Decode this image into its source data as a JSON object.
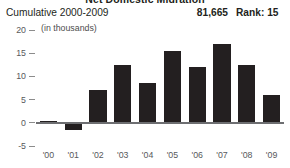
{
  "panel": {
    "clipped_title": "Net Domestic Migration",
    "header": {
      "label": "Cumulative 2000-2009",
      "value": "81,665",
      "rank": "Rank: 15"
    },
    "units_label": "(in thousands)",
    "colors": {
      "bar": "#231f20",
      "axis": "#6d6e71",
      "tick_text": "#58595b",
      "text": "#231f20"
    }
  },
  "chart_data": {
    "type": "bar",
    "title": "Net Domestic Migration",
    "subtitle": "Cumulative 2000-2009",
    "xlabel": "",
    "ylabel": "(in thousands)",
    "categories": [
      "'00",
      "'01",
      "'02",
      "'03",
      "'04",
      "'05",
      "'06",
      "'07",
      "'08",
      "'09"
    ],
    "values": [
      0.3,
      -1.5,
      7.0,
      12.5,
      8.5,
      15.5,
      12.0,
      17.0,
      12.5,
      6.0
    ],
    "ylim": [
      -5,
      20
    ],
    "yticks": [
      20,
      15,
      10,
      5,
      0,
      -5
    ],
    "ytick_labels": [
      "20",
      "15",
      "10",
      "5",
      "0",
      "-5"
    ],
    "grid": false,
    "legend": false,
    "annotations": [
      {
        "text": "81,665",
        "role": "cumulative-total"
      },
      {
        "text": "Rank: 15",
        "role": "rank"
      }
    ]
  }
}
